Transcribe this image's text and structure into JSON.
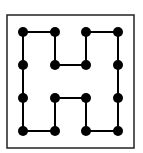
{
  "diagram": {
    "frame": {
      "x": 7,
      "y": 15,
      "width": 127,
      "height": 133,
      "stroke": "#222222"
    },
    "grid_x": [
      23,
      55,
      86,
      118
    ],
    "grid_y": [
      32,
      65,
      98,
      131
    ],
    "dot_radius": 5,
    "dot_color": "#000000",
    "line_color": "#000000",
    "edges": [
      [
        [
          0,
          0
        ],
        [
          1,
          0
        ]
      ],
      [
        [
          2,
          0
        ],
        [
          3,
          0
        ]
      ],
      [
        [
          0,
          0
        ],
        [
          0,
          1
        ]
      ],
      [
        [
          0,
          1
        ],
        [
          0,
          2
        ]
      ],
      [
        [
          0,
          2
        ],
        [
          0,
          3
        ]
      ],
      [
        [
          1,
          0
        ],
        [
          1,
          1
        ]
      ],
      [
        [
          1,
          1
        ],
        [
          2,
          1
        ]
      ],
      [
        [
          2,
          1
        ],
        [
          2,
          0
        ]
      ],
      [
        [
          3,
          0
        ],
        [
          3,
          1
        ]
      ],
      [
        [
          3,
          1
        ],
        [
          3,
          2
        ]
      ],
      [
        [
          3,
          2
        ],
        [
          3,
          3
        ]
      ],
      [
        [
          0,
          3
        ],
        [
          1,
          3
        ]
      ],
      [
        [
          1,
          3
        ],
        [
          1,
          2
        ]
      ],
      [
        [
          1,
          2
        ],
        [
          2,
          2
        ]
      ],
      [
        [
          2,
          2
        ],
        [
          2,
          3
        ]
      ],
      [
        [
          2,
          3
        ],
        [
          3,
          3
        ]
      ]
    ]
  }
}
